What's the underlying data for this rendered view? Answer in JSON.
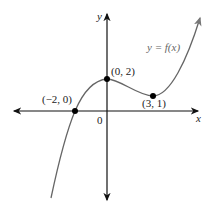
{
  "axes": {
    "x_label": "x",
    "y_label": "y",
    "origin_label": "0"
  },
  "function_label": "y = f(x)",
  "points": [
    {
      "label": "(−2, 0)",
      "x": -2,
      "y": 0
    },
    {
      "label": "(0, 2)",
      "x": 0,
      "y": 2
    },
    {
      "label": "(3, 1)",
      "x": 3,
      "y": 1
    }
  ],
  "colors": {
    "axis": "#111111",
    "curve": "#666666",
    "point": "#000000"
  }
}
